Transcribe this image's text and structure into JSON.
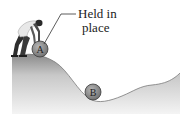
{
  "figure": {
    "label": {
      "line1": "Held in",
      "line2": "place"
    },
    "balls": [
      {
        "id": "A",
        "letter": "A",
        "description": "ball held at top of hill"
      },
      {
        "id": "B",
        "letter": "B",
        "description": "ball at bottom of valley"
      }
    ],
    "colors": {
      "ground_dark": "#8a8a8a",
      "ground_light": "#f2f2f2",
      "ball_fill": "#8c8c8c",
      "ball_stroke": "#3a3a3a",
      "person": "#2e2e2e",
      "shirt": "#e8e8e8"
    }
  }
}
